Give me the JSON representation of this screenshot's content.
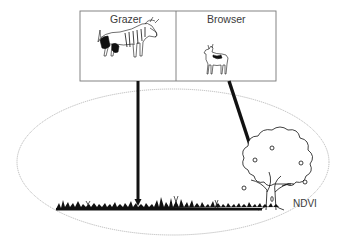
{
  "diagram": {
    "panels": [
      {
        "label": "Grazer",
        "animal": "wildebeest-icon"
      },
      {
        "label": "Browser",
        "animal": "antelope-icon"
      }
    ],
    "landscape_label": "NDVI",
    "vegetation": [
      "grass-icon",
      "tree-icon"
    ],
    "colors": {
      "ink": "#111111",
      "frame": "#777777",
      "ellipse": "#aaaaaa",
      "text": "#3a3a3a"
    }
  }
}
